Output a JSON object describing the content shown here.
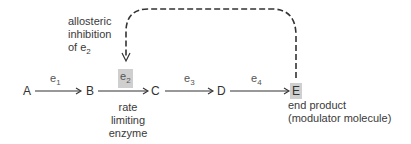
{
  "diagram": {
    "nodes": [
      {
        "id": "A",
        "label": "A"
      },
      {
        "id": "B",
        "label": "B"
      },
      {
        "id": "C",
        "label": "C"
      },
      {
        "id": "D",
        "label": "D"
      },
      {
        "id": "E",
        "label": "E",
        "highlighted": true
      }
    ],
    "enzymes": [
      {
        "id": "e1",
        "base": "e",
        "sub": "1",
        "from": "A",
        "to": "B"
      },
      {
        "id": "e2",
        "base": "e",
        "sub": "2",
        "from": "B",
        "to": "C",
        "highlighted": true
      },
      {
        "id": "e3",
        "base": "e",
        "sub": "3",
        "from": "C",
        "to": "D"
      },
      {
        "id": "e4",
        "base": "e",
        "sub": "4",
        "from": "D",
        "to": "E"
      }
    ],
    "feedback": {
      "from": "E",
      "to": "e2",
      "style": "dashed",
      "label_lines": [
        "allosteric",
        "inhibition",
        "of e"
      ],
      "label_sub": "2"
    },
    "annotations": {
      "rate_limiting": [
        "rate",
        "limiting",
        "enzyme"
      ],
      "end_product": [
        "end product",
        "(modulator molecule)"
      ]
    },
    "colors": {
      "line": "#333333",
      "highlight": "#cfcfcf"
    }
  }
}
